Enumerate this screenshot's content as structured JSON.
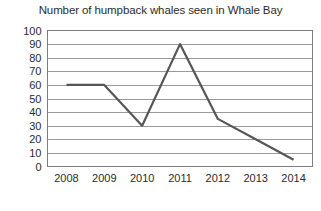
{
  "chart_data": {
    "type": "line",
    "title": "Number of humpback whales seen in Whale Bay",
    "xlabel": "",
    "ylabel": "",
    "categories": [
      "2008",
      "2009",
      "2010",
      "2011",
      "2012",
      "2013",
      "2014"
    ],
    "values": [
      60,
      60,
      30,
      90,
      35,
      20,
      5
    ],
    "series": [
      {
        "name": "Humpback whales seen",
        "values": [
          60,
          60,
          30,
          90,
          35,
          20,
          5
        ]
      }
    ],
    "ylim": [
      0,
      100
    ],
    "y_ticks": [
      0,
      10,
      20,
      30,
      40,
      50,
      60,
      70,
      80,
      90,
      100
    ],
    "x_tick_labels": [
      "2008",
      "2009",
      "2010",
      "2011",
      "2012",
      "2013",
      "2014"
    ],
    "grid": "horizontal",
    "legend": "none",
    "line_color": "#565656",
    "gridline_color": "#9a9a9a",
    "frame_color": "#7d7d7d",
    "background_color": "#ffffff"
  }
}
